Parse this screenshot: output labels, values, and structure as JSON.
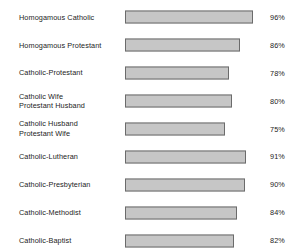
{
  "chart_data": {
    "type": "bar",
    "title": "",
    "subtitle": "",
    "xlabel": "",
    "ylabel": "",
    "orientation": "horizontal",
    "grid": false,
    "legend": null,
    "xlim": [
      0,
      100
    ],
    "value_suffix": "%",
    "categories": [
      "Homogamous Catholic",
      "Homogamous Protestant",
      "Catholic-Protestant",
      "Catholic Wife\nProtestant Husband",
      "Catholic Husband\nProtestant Wife",
      "Catholic-Lutheran",
      "Catholic-Presbyterian",
      "Catholic-Methodist",
      "Catholic-Baptist"
    ],
    "values": [
      96,
      86,
      78,
      80,
      75,
      91,
      90,
      84,
      82
    ],
    "value_labels": [
      "96%",
      "86%",
      "78%",
      "80%",
      "75%",
      "91%",
      "90%",
      "84%",
      "82%"
    ],
    "colors": {
      "bar_fill": "#c6c6c6",
      "bar_border": "#6b6b6b",
      "text": "#1c1c1c",
      "background": "#ffffff"
    }
  }
}
